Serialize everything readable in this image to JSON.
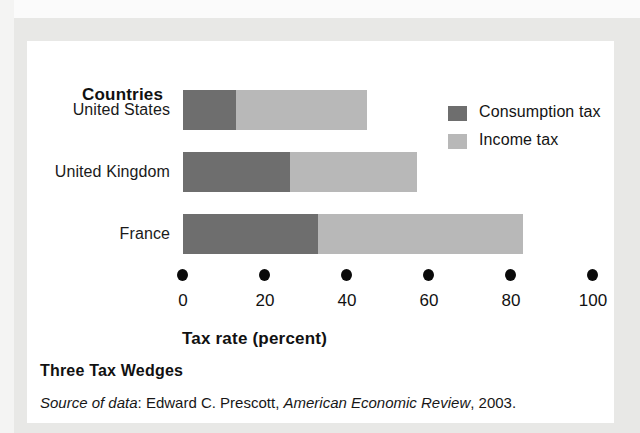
{
  "figure": {
    "title": "Three Tax Wedges",
    "source_prefix": "Source of data",
    "source_sep": ": ",
    "source_author": "Edward C. Prescott, ",
    "source_journal": "American Economic Review",
    "source_year": ", 2003.",
    "category_axis_heading": "Countries"
  },
  "legend": {
    "position": "top-right",
    "entries": [
      {
        "label": "Consumption tax",
        "color": "#6e6e6e"
      },
      {
        "label": "Income tax",
        "color": "#b8b8b8"
      }
    ]
  },
  "chart_data": {
    "type": "bar",
    "orientation": "horizontal",
    "stacked": true,
    "title": "Three Tax Wedges",
    "xlabel": "Tax rate (percent)",
    "ylabel": "Countries",
    "xlim": [
      0,
      100
    ],
    "xticks": [
      0,
      20,
      40,
      60,
      80,
      100
    ],
    "xtick_labels": [
      "0",
      "20",
      "40",
      "60",
      "80",
      "100"
    ],
    "grid": false,
    "tick_marker": "filled-circle",
    "categories": [
      "United States",
      "United Kingdom",
      "France"
    ],
    "series": [
      {
        "name": "Consumption tax",
        "color": "#6e6e6e",
        "values": [
          13,
          26,
          33
        ]
      },
      {
        "name": "Income tax",
        "color": "#b8b8b8",
        "values": [
          32,
          31,
          50
        ]
      }
    ],
    "totals": [
      45,
      57,
      83
    ],
    "annotations": []
  }
}
